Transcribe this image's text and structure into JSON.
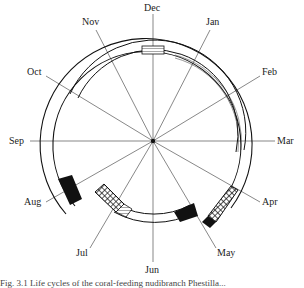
{
  "diagram": {
    "type": "circular-calendar-diagram",
    "center": [
      153,
      141
    ],
    "months": [
      {
        "name": "Dec",
        "angle": 0,
        "x": 144,
        "y": 6
      },
      {
        "name": "Jan",
        "angle": 30,
        "x": 206,
        "y": 20
      },
      {
        "name": "Feb",
        "angle": 60,
        "x": 262,
        "y": 70
      },
      {
        "name": "Mar",
        "angle": 90,
        "x": 277,
        "y": 136
      },
      {
        "name": "Apr",
        "angle": 120,
        "x": 262,
        "y": 197
      },
      {
        "name": "May",
        "angle": 150,
        "x": 219,
        "y": 248
      },
      {
        "name": "Jun",
        "angle": 180,
        "x": 145,
        "y": 265
      },
      {
        "name": "Jul",
        "angle": 210,
        "x": 76,
        "y": 248
      },
      {
        "name": "Aug",
        "angle": 240,
        "x": 25,
        "y": 197
      },
      {
        "name": "Sep",
        "angle": 270,
        "x": 10,
        "y": 136
      },
      {
        "name": "Oct",
        "angle": 300,
        "x": 27,
        "y": 70
      },
      {
        "name": "Nov",
        "angle": 330,
        "x": 82,
        "y": 20
      }
    ],
    "segments": [
      {
        "label": "outer-ring",
        "from": 0,
        "to": 360
      },
      {
        "label": "dec-box",
        "fill": "hatch-horizontal"
      },
      {
        "label": "apr-crosshatch",
        "fill": "crosshatch"
      },
      {
        "label": "may-black",
        "fill": "solid-black"
      },
      {
        "label": "jul-crosshatch",
        "fill": "crosshatch"
      },
      {
        "label": "aug-black",
        "fill": "solid-black"
      }
    ]
  },
  "caption": "Fig. 3.1 Life cycles of the coral-feeding nudibranch Phestilla..."
}
